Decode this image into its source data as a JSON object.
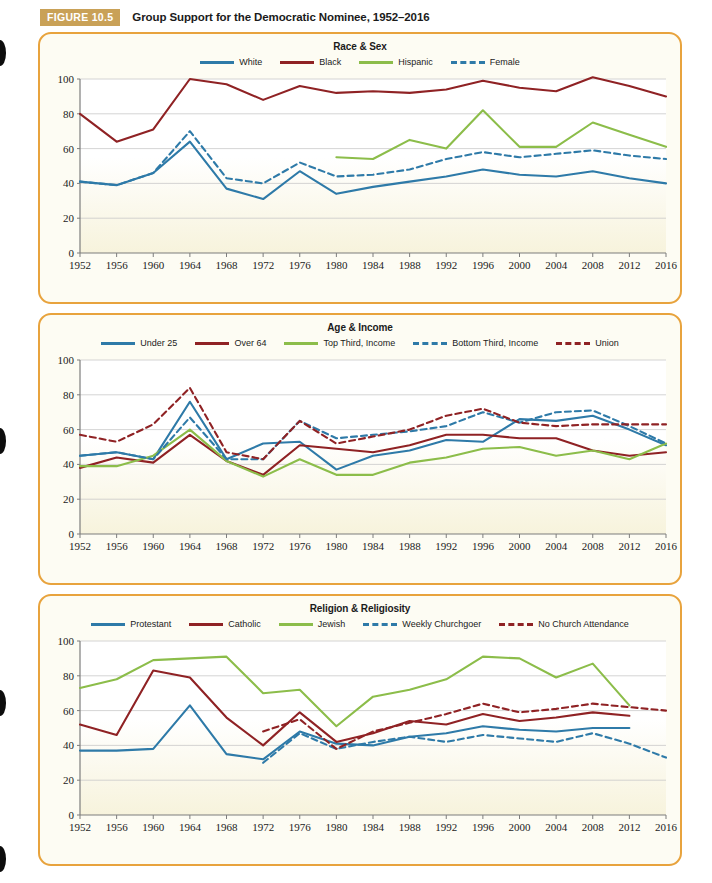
{
  "figure": {
    "badge": "FIGURE 10.5",
    "title": "Group Support for the Democratic Nominee, 1952–2016"
  },
  "colors": {
    "blue": "#2e7aa8",
    "darkred": "#8f2224",
    "green": "#8cbd4a",
    "border": "#e8a33d",
    "badge_bg": "#c9a157",
    "panel_bg_top": "#ffffff",
    "panel_bg_bottom": "#f7f3dc",
    "grid": "#c9c9c9",
    "axis": "#7d7d7d",
    "text": "#1b1b1b"
  },
  "axis": {
    "x_ticks": [
      "1952",
      "1956",
      "1960",
      "1964",
      "1968",
      "1972",
      "1976",
      "1980",
      "1984",
      "1988",
      "1992",
      "1996",
      "2000",
      "2004",
      "2008",
      "2012",
      "2016"
    ],
    "y_ticks": [
      "0",
      "20",
      "40",
      "60",
      "80",
      "100"
    ],
    "ylim": [
      0,
      100
    ],
    "xlim": [
      1952,
      2016
    ]
  },
  "chart_data": [
    {
      "type": "line",
      "title": "Race & Sex",
      "xlabel": "",
      "ylabel": "",
      "ylim": [
        0,
        100
      ],
      "grid": true,
      "legend_position": "top",
      "x": [
        1952,
        1956,
        1960,
        1964,
        1968,
        1972,
        1976,
        1980,
        1984,
        1988,
        1992,
        1996,
        2000,
        2004,
        2008,
        2012,
        2016
      ],
      "series": [
        {
          "name": "White",
          "color": "#2e7aa8",
          "style": "solid",
          "values": [
            41,
            39,
            46,
            64,
            37,
            31,
            47,
            34,
            38,
            41,
            44,
            48,
            45,
            44,
            47,
            43,
            40
          ]
        },
        {
          "name": "Black",
          "color": "#8f2224",
          "style": "solid",
          "values": [
            80,
            64,
            71,
            100,
            97,
            88,
            96,
            92,
            93,
            92,
            94,
            99,
            95,
            93,
            101,
            96,
            90
          ]
        },
        {
          "name": "Hispanic",
          "color": "#8cbd4a",
          "style": "solid",
          "values": [
            null,
            null,
            null,
            null,
            null,
            null,
            null,
            55,
            54,
            65,
            60,
            82,
            61,
            61,
            75,
            68,
            61
          ]
        },
        {
          "name": "Female",
          "color": "#2e7aa8",
          "style": "dashed",
          "values": [
            41,
            39,
            46,
            70,
            43,
            40,
            52,
            44,
            45,
            48,
            54,
            58,
            55,
            57,
            59,
            56,
            54
          ]
        }
      ]
    },
    {
      "type": "line",
      "title": "Age & Income",
      "xlabel": "",
      "ylabel": "",
      "ylim": [
        0,
        100
      ],
      "grid": true,
      "legend_position": "top",
      "x": [
        1952,
        1956,
        1960,
        1964,
        1968,
        1972,
        1976,
        1980,
        1984,
        1988,
        1992,
        1996,
        2000,
        2004,
        2008,
        2012,
        2016
      ],
      "series": [
        {
          "name": "Under 25",
          "color": "#2e7aa8",
          "style": "solid",
          "values": [
            45,
            47,
            43,
            76,
            43,
            52,
            53,
            37,
            45,
            48,
            54,
            53,
            66,
            65,
            68,
            60,
            51
          ]
        },
        {
          "name": "Over 64",
          "color": "#8f2224",
          "style": "solid",
          "values": [
            38,
            44,
            41,
            57,
            42,
            34,
            51,
            49,
            47,
            51,
            57,
            57,
            55,
            55,
            48,
            45,
            47
          ]
        },
        {
          "name": "Top Third, Income",
          "color": "#8cbd4a",
          "style": "solid",
          "values": [
            39,
            39,
            45,
            60,
            42,
            33,
            43,
            34,
            34,
            41,
            44,
            49,
            50,
            45,
            48,
            43,
            52
          ]
        },
        {
          "name": "Bottom Third, Income",
          "color": "#2e7aa8",
          "style": "dashed",
          "values": [
            45,
            47,
            43,
            67,
            43,
            43,
            65,
            55,
            57,
            59,
            62,
            70,
            64,
            70,
            71,
            62,
            52
          ]
        },
        {
          "name": "Union",
          "color": "#8f2224",
          "style": "dashed",
          "values": [
            57,
            53,
            63,
            84,
            47,
            43,
            65,
            52,
            56,
            60,
            68,
            72,
            64,
            62,
            63,
            63,
            63
          ]
        }
      ]
    },
    {
      "type": "line",
      "title": "Religion & Religiosity",
      "xlabel": "",
      "ylabel": "",
      "ylim": [
        0,
        100
      ],
      "grid": true,
      "legend_position": "top",
      "x": [
        1952,
        1956,
        1960,
        1964,
        1968,
        1972,
        1976,
        1980,
        1984,
        1988,
        1992,
        1996,
        2000,
        2004,
        2008,
        2012,
        2016
      ],
      "series": [
        {
          "name": "Protestant",
          "color": "#2e7aa8",
          "style": "solid",
          "values": [
            37,
            37,
            38,
            63,
            35,
            32,
            48,
            41,
            40,
            45,
            47,
            51,
            49,
            48,
            50,
            50,
            null
          ]
        },
        {
          "name": "Catholic",
          "color": "#8f2224",
          "style": "solid",
          "values": [
            52,
            46,
            83,
            79,
            56,
            40,
            59,
            42,
            47,
            54,
            52,
            58,
            54,
            56,
            59,
            57,
            null
          ]
        },
        {
          "name": "Jewish",
          "color": "#8cbd4a",
          "style": "solid",
          "values": [
            73,
            78,
            89,
            90,
            91,
            70,
            72,
            51,
            68,
            72,
            78,
            91,
            90,
            79,
            87,
            63,
            null
          ]
        },
        {
          "name": "Weekly Churchgoer",
          "color": "#2e7aa8",
          "style": "dashed",
          "values": [
            null,
            null,
            null,
            null,
            null,
            30,
            47,
            38,
            42,
            45,
            42,
            46,
            44,
            42,
            47,
            41,
            33
          ]
        },
        {
          "name": "No Church Attendance",
          "color": "#8f2224",
          "style": "dashed",
          "values": [
            null,
            null,
            null,
            null,
            null,
            48,
            55,
            38,
            48,
            53,
            58,
            64,
            59,
            61,
            64,
            62,
            60
          ]
        }
      ]
    }
  ]
}
